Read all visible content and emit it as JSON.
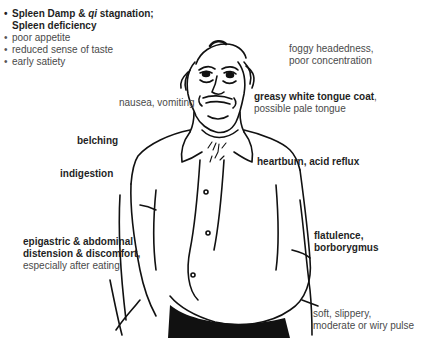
{
  "diagram": {
    "title_block": {
      "heading_parts": [
        "Spleen Damp & ",
        "qi",
        " stagnation;"
      ],
      "heading_line2": "Spleen deficiency",
      "bullets": [
        "poor appetite",
        "reduced sense of taste",
        "early satiety"
      ]
    },
    "labels": {
      "foggy": [
        "foggy headedness,",
        "poor concentration"
      ],
      "nausea": "nausea, vomiting",
      "tongue_bold": "greasy white tongue coat",
      "tongue_comma": ",",
      "tongue_line2": "possible pale tongue",
      "belching": "belching",
      "heartburn": "heartburn, acid reflux",
      "indigestion": "indigestion",
      "flatulence": [
        "flatulence,",
        "borborygmus"
      ],
      "distension_bold": [
        "epigastric & abdominal",
        "distension & discomfort,"
      ],
      "distension_line3": "especially after eating",
      "pulse": [
        "soft, slippery,",
        "moderate or wiry pulse"
      ]
    },
    "figure": {
      "description": "line drawing of a tired overweight man with bloated abdomen",
      "ink_color": "#111111",
      "background": "#ffffff"
    }
  }
}
